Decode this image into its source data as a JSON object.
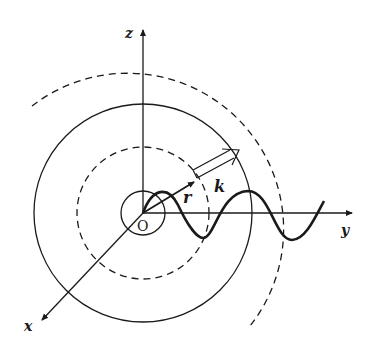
{
  "diagram": {
    "origin_label": "O",
    "axes": {
      "x": {
        "label": "x"
      },
      "y": {
        "label": "y"
      },
      "z": {
        "label": "z"
      }
    },
    "vectors": [
      {
        "name": "r",
        "label": "r",
        "style": "solid filled arrow"
      },
      {
        "name": "k",
        "label": "k",
        "style": "hollow double-line arrow"
      }
    ],
    "wavefronts": [
      {
        "type": "solid",
        "radius": 22
      },
      {
        "type": "dashed",
        "radius": 66
      },
      {
        "type": "solid",
        "radius": 109
      },
      {
        "type": "dashed",
        "radius": 156
      }
    ],
    "wave": {
      "type": "sinusoid",
      "along_axis": "y"
    },
    "colors": {
      "ink": "#1a1a1a",
      "background": "#ffffff"
    }
  }
}
